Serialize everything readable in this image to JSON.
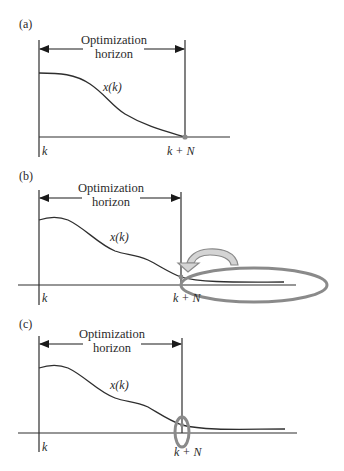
{
  "figure": {
    "panels": [
      {
        "id": "a",
        "label": "(a)",
        "horizon_line1": "Optimization",
        "horizon_line2": "horizon",
        "curve_label": "x(k)",
        "tick_start": "k",
        "tick_end": "k + N",
        "annotation": "terminal point at k + N"
      },
      {
        "id": "b",
        "label": "(b)",
        "horizon_line1": "Optimization",
        "horizon_line2": "horizon",
        "curve_label": "x(k)",
        "tick_start": "k",
        "tick_end": "k + N",
        "annotation": "terminal region ellipse with curved arrow"
      },
      {
        "id": "c",
        "label": "(c)",
        "horizon_line1": "Optimization",
        "horizon_line2": "horizon",
        "curve_label": "x(k)",
        "tick_start": "k",
        "tick_end": "k + N",
        "annotation": "small terminal set ellipse at k + N"
      }
    ],
    "colors": {
      "line": "#2e2e2e",
      "highlight": "#8a8a8a",
      "arrow_fill": "#d4d4d4"
    }
  }
}
